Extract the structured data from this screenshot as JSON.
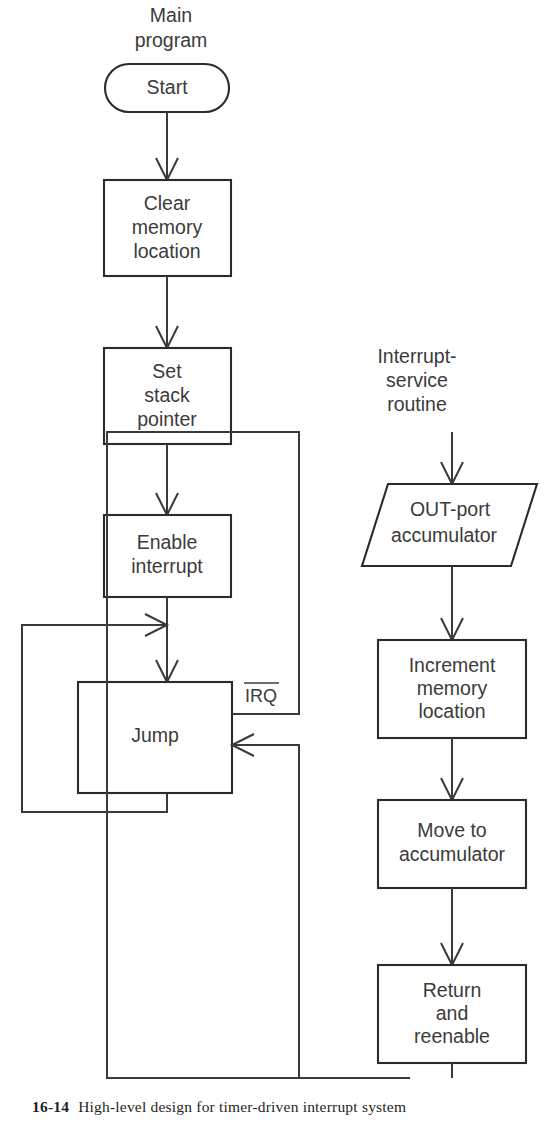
{
  "figure": {
    "caption_number": "16-14",
    "caption_text": "High-level design for timer-driven interrupt system",
    "background_color": "#ffffff",
    "line_color": "#3a3a3a",
    "text_color": "#3b3b3b"
  },
  "columns": {
    "main": {
      "header_line1": "Main",
      "header_line2": "program"
    },
    "isr": {
      "header_line1": "Interrupt-",
      "header_line2": "service",
      "header_line3": "routine"
    }
  },
  "main_program": {
    "start": {
      "shape": "terminator",
      "text": "Start"
    },
    "clear_memory": {
      "shape": "process",
      "line1": "Clear",
      "line2": "memory",
      "line3": "location"
    },
    "set_stack": {
      "shape": "process",
      "line1": "Set",
      "line2": "stack",
      "line3": "pointer"
    },
    "enable_interrupt": {
      "shape": "process",
      "line1": "Enable",
      "line2": "interrupt"
    },
    "jump": {
      "shape": "process",
      "text": "Jump"
    }
  },
  "interrupt_service_routine": {
    "out_port": {
      "shape": "input-output",
      "line1": "OUT-port",
      "line2": "accumulator"
    },
    "increment_memory": {
      "shape": "process",
      "line1": "Increment",
      "line2": "memory",
      "line3": "location"
    },
    "move_to_acc": {
      "shape": "process",
      "line1": "Move to",
      "line2": "accumulator"
    },
    "return_reenable": {
      "shape": "process",
      "line1": "Return",
      "line2": "and",
      "line3": "reenable"
    }
  },
  "signals": {
    "irq": {
      "label": "IRQ",
      "active_low": true
    }
  }
}
